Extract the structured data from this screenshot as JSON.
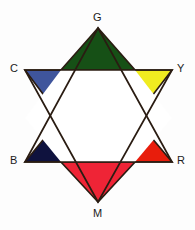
{
  "figure": {
    "type": "color-star-diagram",
    "background_color": "#fdfdfd",
    "outline_color": "#2a1c12",
    "center_fill": "#ffffff",
    "width": 195,
    "height": 230
  },
  "chart_data": {
    "type": "pie",
    "title": "",
    "xlabel": "",
    "ylabel": "",
    "legend_position": "vertex-labels",
    "grid": false,
    "categories": [
      "G",
      "Y",
      "R",
      "M",
      "B",
      "C"
    ],
    "values": [
      1,
      1,
      1,
      1,
      1,
      1
    ],
    "series": [
      {
        "name": "Star of David color wheel",
        "values": [
          1,
          1,
          1,
          1,
          1,
          1
        ]
      }
    ],
    "annotations": [
      "Six-pointed star (hexagram) with white hexagonal core",
      "Upward triangle points: G (top), B (lower-left), R (lower-right)",
      "Downward triangle points: M (bottom), C (upper-left), Y (upper-right)"
    ]
  },
  "points": [
    {
      "id": "G",
      "label": "G",
      "name": "green",
      "fill": "#165016",
      "position": "top",
      "triangle": "upward",
      "apex": [
        98,
        28
      ],
      "left": [
        61,
        70
      ],
      "right": [
        135,
        70
      ]
    },
    {
      "id": "Y",
      "label": "Y",
      "name": "yellow",
      "fill": "#f0ec20",
      "position": "upper-right",
      "triangle": "downward",
      "apex": [
        135,
        118
      ],
      "left": [
        135,
        70
      ],
      "right": [
        172,
        70
      ]
    },
    {
      "id": "R",
      "label": "R",
      "name": "red",
      "fill": "#e81d0c",
      "position": "lower-right",
      "triangle": "upward",
      "apex": [
        135,
        118
      ],
      "left": [
        135,
        162
      ],
      "right": [
        172,
        162
      ]
    },
    {
      "id": "M",
      "label": "M",
      "name": "magenta",
      "fill": "#ef2436",
      "position": "bottom",
      "triangle": "downward",
      "apex": [
        98,
        202
      ],
      "left": [
        61,
        162
      ],
      "right": [
        135,
        162
      ]
    },
    {
      "id": "B",
      "label": "B",
      "name": "blue",
      "fill": "#0f123e",
      "position": "lower-left",
      "triangle": "upward",
      "apex": [
        61,
        118
      ],
      "left": [
        25,
        162
      ],
      "right": [
        61,
        162
      ]
    },
    {
      "id": "C",
      "label": "C",
      "name": "cyan",
      "fill": "#3f559c",
      "position": "upper-left",
      "triangle": "downward",
      "apex": [
        61,
        118
      ],
      "left": [
        25,
        70
      ],
      "right": [
        61,
        70
      ]
    }
  ],
  "triangles": {
    "upward": {
      "name": "upward-triangle",
      "points": "98,28 172,162 25,162"
    },
    "downward": {
      "name": "downward-triangle",
      "points": "98,202 25,70 172,70"
    }
  },
  "hexagon": {
    "name": "center-hexagon",
    "points": "61,70 135,70 172,70 135,118 135,162 61,162 25,118 61,118",
    "core_points": "61,70 135,70 172,118 135,162 61,162 25,118"
  }
}
